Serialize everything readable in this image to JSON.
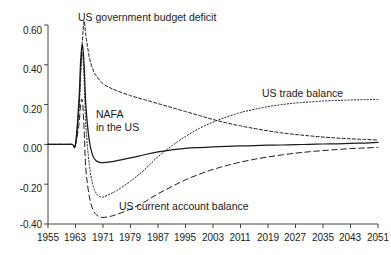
{
  "chart_data": {
    "type": "line",
    "title": "",
    "xlabel": "",
    "ylabel": "",
    "xlim": [
      1955,
      2051
    ],
    "ylim": [
      -0.4,
      0.6
    ],
    "grid": false,
    "legend_position": "inline-annotations",
    "xticks": [
      "1955",
      "1963",
      "1971",
      "1979",
      "1987",
      "1995",
      "2003",
      "2011",
      "2019",
      "2027",
      "2035",
      "2043",
      "2051"
    ],
    "yticks": [
      "0.60",
      "0.40",
      "0.20",
      "0.00",
      "-0.20",
      "-0.40"
    ],
    "annotations": [
      {
        "text": "US government budget deficit",
        "series": "US government budget deficit"
      },
      {
        "text": "NAFA in the US",
        "series": "NAFA in the US"
      },
      {
        "text": "US trade balance",
        "series": "US trade balance"
      },
      {
        "text": "US current account balance",
        "series": "US current account balance"
      }
    ],
    "series": [
      {
        "name": "US government budget deficit",
        "style": "dashed",
        "x": [
          1955,
          1959,
          1962,
          1963,
          1964,
          1964.5,
          1965,
          1965.5,
          1966,
          1967,
          1968,
          1969,
          1971,
          1973,
          1975,
          1979,
          1983,
          1987,
          1991,
          1995,
          1999,
          2003,
          2007,
          2011,
          2015,
          2019,
          2023,
          2027,
          2031,
          2035,
          2039,
          2043,
          2047,
          2051
        ],
        "values": [
          0.0,
          0.0,
          0.0,
          0.0,
          0.18,
          0.36,
          0.52,
          0.62,
          0.55,
          0.44,
          0.38,
          0.345,
          0.305,
          0.285,
          0.27,
          0.245,
          0.225,
          0.205,
          0.185,
          0.165,
          0.145,
          0.125,
          0.108,
          0.093,
          0.08,
          0.068,
          0.058,
          0.05,
          0.043,
          0.037,
          0.032,
          0.028,
          0.025,
          0.022
        ]
      },
      {
        "name": "NAFA in the US",
        "style": "solid",
        "x": [
          1955,
          1959,
          1962,
          1963,
          1964,
          1964.5,
          1965,
          1965.5,
          1966,
          1967,
          1968,
          1969,
          1970,
          1971,
          1973,
          1975,
          1979,
          1983,
          1987,
          1991,
          1995,
          1999,
          2003,
          2007,
          2011,
          2015,
          2019,
          2023,
          2027,
          2031,
          2035,
          2039,
          2043,
          2047,
          2051
        ],
        "values": [
          0.0,
          0.0,
          0.0,
          0.0,
          0.22,
          0.42,
          0.5,
          0.4,
          0.2,
          0.02,
          -0.055,
          -0.082,
          -0.09,
          -0.091,
          -0.088,
          -0.082,
          -0.068,
          -0.052,
          -0.038,
          -0.027,
          -0.02,
          -0.016,
          -0.013,
          -0.01,
          -0.008,
          -0.006,
          -0.004,
          -0.003,
          -0.001,
          0.0,
          0.002,
          0.003,
          0.005,
          0.007,
          0.01
        ]
      },
      {
        "name": "US trade balance",
        "style": "dotted",
        "x": [
          1955,
          1959,
          1962,
          1963,
          1964,
          1964.5,
          1965,
          1965.5,
          1966,
          1967,
          1968,
          1969,
          1970,
          1971,
          1973,
          1975,
          1979,
          1983,
          1987,
          1991,
          1995,
          1999,
          2003,
          2007,
          2011,
          2015,
          2019,
          2023,
          2027,
          2031,
          2035,
          2039,
          2043,
          2047,
          2051
        ],
        "values": [
          0.0,
          0.0,
          0.0,
          0.0,
          0.18,
          0.36,
          0.46,
          0.33,
          0.1,
          -0.1,
          -0.2,
          -0.245,
          -0.262,
          -0.265,
          -0.25,
          -0.232,
          -0.185,
          -0.128,
          -0.062,
          -0.008,
          0.04,
          0.08,
          0.112,
          0.138,
          0.16,
          0.176,
          0.19,
          0.2,
          0.208,
          0.213,
          0.218,
          0.221,
          0.223,
          0.225,
          0.226
        ]
      },
      {
        "name": "US current account balance",
        "style": "long-dashed",
        "x": [
          1955,
          1959,
          1962,
          1963,
          1964,
          1964.5,
          1965,
          1965.5,
          1966,
          1967,
          1968,
          1969,
          1970,
          1971,
          1973,
          1975,
          1979,
          1983,
          1987,
          1991,
          1995,
          1999,
          2003,
          2007,
          2011,
          2015,
          2019,
          2023,
          2027,
          2031,
          2035,
          2039,
          2043,
          2047,
          2051
        ],
        "values": [
          0.0,
          0.0,
          0.0,
          0.0,
          0.1,
          0.2,
          0.22,
          0.08,
          -0.12,
          -0.26,
          -0.325,
          -0.352,
          -0.363,
          -0.367,
          -0.362,
          -0.352,
          -0.325,
          -0.29,
          -0.248,
          -0.212,
          -0.178,
          -0.15,
          -0.126,
          -0.106,
          -0.089,
          -0.075,
          -0.063,
          -0.053,
          -0.044,
          -0.037,
          -0.031,
          -0.026,
          -0.021,
          -0.018,
          -0.015
        ]
      }
    ]
  },
  "labels": {
    "budget_deficit": "US government budget deficit",
    "nafa_line1": "NAFA",
    "nafa_line2": "in the US",
    "trade_balance": "US trade balance",
    "current_account": "US current account balance"
  },
  "yticks": {
    "t0": "0.60",
    "t1": "0.40",
    "t2": "0.20",
    "t3": "0.00",
    "t4": "-0.20",
    "t5": "-0.40"
  },
  "xticks": {
    "t0": "1955",
    "t1": "1963",
    "t2": "1971",
    "t3": "1979",
    "t4": "1987",
    "t5": "1995",
    "t6": "2003",
    "t7": "2011",
    "t8": "2019",
    "t9": "2027",
    "t10": "2035",
    "t11": "2043",
    "t12": "2051"
  },
  "colors": {
    "axis": "#444444",
    "line": "#1a1a1a",
    "background": "#ffffff"
  }
}
